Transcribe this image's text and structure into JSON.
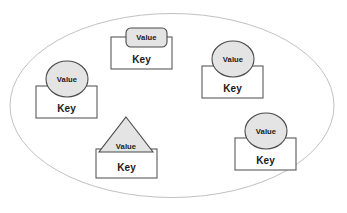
{
  "diagram": {
    "title": "",
    "container": {
      "shape": "ellipse",
      "name": "outer-boundary-ellipse",
      "cx": 172,
      "cy": 105.5,
      "rx": 162,
      "ry": 92,
      "fill": "#ffffff",
      "stroke": "#b9b9b9",
      "stroke_width": 0.9
    },
    "style": {
      "value_fill": "#e4e4e4",
      "value_stroke": "#4a4a4a",
      "key_fill": "#ffffff",
      "key_stroke": "#5a5a5a",
      "text_color": "#1a1a1a"
    },
    "nodes": [
      {
        "id": "node-top",
        "name": "key-value-group-top",
        "value_shape": "rounded-rect",
        "value_label": "Value",
        "key_label": "Key",
        "key_rect": {
          "x": 111,
          "y": 37,
          "w": 61,
          "h": 32
        },
        "value_rect": {
          "x": 126,
          "y": 28,
          "w": 41,
          "h": 19,
          "r": 5
        },
        "value_text": {
          "x": 146.5,
          "y": 40.2
        },
        "key_text": {
          "x": 141.5,
          "y": 62.5
        }
      },
      {
        "id": "node-left",
        "name": "key-value-group-left",
        "value_shape": "ellipse",
        "value_label": "Value",
        "key_label": "Key",
        "key_rect": {
          "x": 36,
          "y": 86,
          "w": 61,
          "h": 32
        },
        "value_ellipse": {
          "cx": 67,
          "cy": 79,
          "rx": 21,
          "ry": 18
        },
        "value_text": {
          "x": 67,
          "y": 81.7
        },
        "key_text": {
          "x": 66.5,
          "y": 111.5
        }
      },
      {
        "id": "node-right-upper",
        "name": "key-value-group-right-upper",
        "value_shape": "ellipse",
        "value_label": "Value",
        "key_label": "Key",
        "key_rect": {
          "x": 202,
          "y": 66,
          "w": 61,
          "h": 32
        },
        "value_ellipse": {
          "cx": 233,
          "cy": 59,
          "rx": 21,
          "ry": 18
        },
        "value_text": {
          "x": 233,
          "y": 61.7
        },
        "key_text": {
          "x": 232.5,
          "y": 91.5
        }
      },
      {
        "id": "node-bottom-center",
        "name": "key-value-group-bottom-center",
        "value_shape": "triangle",
        "value_label": "Value",
        "key_label": "Key",
        "key_rect": {
          "x": 96,
          "y": 149,
          "w": 61,
          "h": 29
        },
        "value_triangle": {
          "apex_x": 126,
          "apex_y": 117,
          "left_x": 99,
          "right_x": 153,
          "base_y": 152
        },
        "value_text": {
          "x": 126,
          "y": 148.5
        },
        "key_text": {
          "x": 126.5,
          "y": 170.5
        }
      },
      {
        "id": "node-right-lower",
        "name": "key-value-group-right-lower",
        "value_shape": "ellipse",
        "value_label": "Value",
        "key_label": "Key",
        "key_rect": {
          "x": 235,
          "y": 138,
          "w": 61,
          "h": 32
        },
        "value_ellipse": {
          "cx": 266,
          "cy": 131,
          "rx": 21,
          "ry": 18
        },
        "value_text": {
          "x": 266,
          "y": 133.7
        },
        "key_text": {
          "x": 265.5,
          "y": 163.5
        }
      }
    ]
  }
}
